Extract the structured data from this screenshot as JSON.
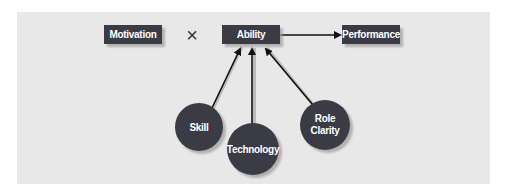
{
  "diagram": {
    "operator_symbol": "×",
    "nodes": {
      "motivation": "Motivation",
      "ability": "Ability",
      "performance": "Performance",
      "skill": "Skill",
      "technology": "Technology",
      "role_clarity_line1": "Role",
      "role_clarity_line2": "Clarity"
    },
    "edges": [
      {
        "from": "Ability",
        "to": "Performance"
      },
      {
        "from": "Skill",
        "to": "Ability"
      },
      {
        "from": "Technology",
        "to": "Ability"
      },
      {
        "from": "Role Clarity",
        "to": "Ability"
      }
    ],
    "colors": {
      "panel": "#e8e8e8",
      "node_fill": "#3a3a44",
      "node_text": "#ffffff",
      "arrow": "#111111"
    }
  }
}
